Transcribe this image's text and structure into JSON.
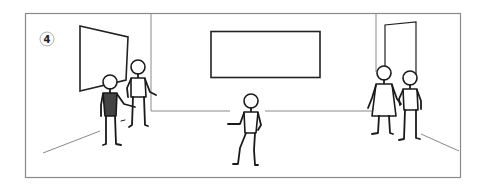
{
  "scene": {
    "panel_number": "4",
    "colors": {
      "frame": "#8a8a8a",
      "ink": "#1a1a1a",
      "shirt_dark": "#444444",
      "background": "#ffffff"
    },
    "elements": [
      {
        "name": "left-wall-whiteboard",
        "type": "quad"
      },
      {
        "name": "back-wall-screen",
        "type": "rect"
      },
      {
        "name": "right-wall-door",
        "type": "quad"
      }
    ],
    "figures": [
      {
        "name": "figure-dark-shirt",
        "description": "person in dark shirt gesturing"
      },
      {
        "name": "figure-standing-left",
        "description": "person standing near whiteboard"
      },
      {
        "name": "figure-walking-center",
        "description": "person walking in center"
      },
      {
        "name": "figure-woman-dress",
        "description": "woman in dress on right"
      },
      {
        "name": "figure-man-right",
        "description": "man standing on right"
      }
    ]
  }
}
